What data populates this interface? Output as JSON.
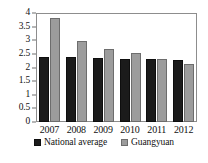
{
  "chart_data": {
    "type": "bar",
    "title": "",
    "subtitle": "",
    "xlabel": "",
    "ylabel": "",
    "categories": [
      "2007",
      "2008",
      "2009",
      "2010",
      "2011",
      "2012"
    ],
    "series": [
      {
        "name": "National average",
        "color": "#1b1b1b",
        "values": [
          2.4,
          2.37,
          2.36,
          2.33,
          2.32,
          2.28
        ]
      },
      {
        "name": "Guangyuan",
        "color": "#9c9c9c",
        "values": [
          3.8,
          2.97,
          2.68,
          2.53,
          2.32,
          2.13
        ]
      }
    ],
    "ylim": [
      0,
      4
    ],
    "yticks": [
      "0",
      "0.5",
      "1",
      "1.5",
      "2",
      "2.5",
      "3",
      "3.5",
      "4"
    ],
    "ytick_values": [
      0,
      0.5,
      1,
      1.5,
      2,
      2.5,
      3,
      3.5,
      4
    ],
    "grid": false,
    "legend_position": "bottom",
    "frame": true,
    "annotations": []
  },
  "legend": {
    "items": [
      {
        "label": "National average",
        "swatch": "black-square-swatch"
      },
      {
        "label": "Guangyuan",
        "swatch": "gray-square-swatch"
      }
    ]
  }
}
